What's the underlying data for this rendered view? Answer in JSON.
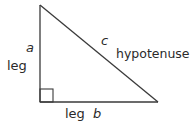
{
  "diagram": {
    "type": "right-triangle",
    "stroke_color": "#3a3a3a",
    "vertices": {
      "top": [
        40,
        5
      ],
      "right_angle": [
        40,
        102
      ],
      "right": [
        158,
        102
      ]
    },
    "labels": {
      "vertical_side_variable": "a",
      "vertical_side_name": "leg",
      "horizontal_side_name": "leg",
      "horizontal_side_variable": "b",
      "hypotenuse_variable": "c",
      "hypotenuse_name": "hypotenuse"
    },
    "right_angle_marker": true
  }
}
